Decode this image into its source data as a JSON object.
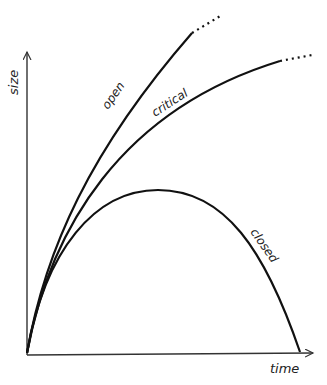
{
  "figure": {
    "type": "conceptual-growth-curves",
    "axes": {
      "x_label": "time",
      "y_label": "size"
    },
    "curves": [
      {
        "name": "open",
        "label": "open",
        "shape": "increasing, concave, continues (dotted extension)"
      },
      {
        "name": "critical",
        "label": "critical",
        "shape": "increasing, less steep, continues (dotted extension)"
      },
      {
        "name": "closed",
        "label": "closed",
        "shape": "rises to a peak then falls back to zero"
      }
    ]
  }
}
